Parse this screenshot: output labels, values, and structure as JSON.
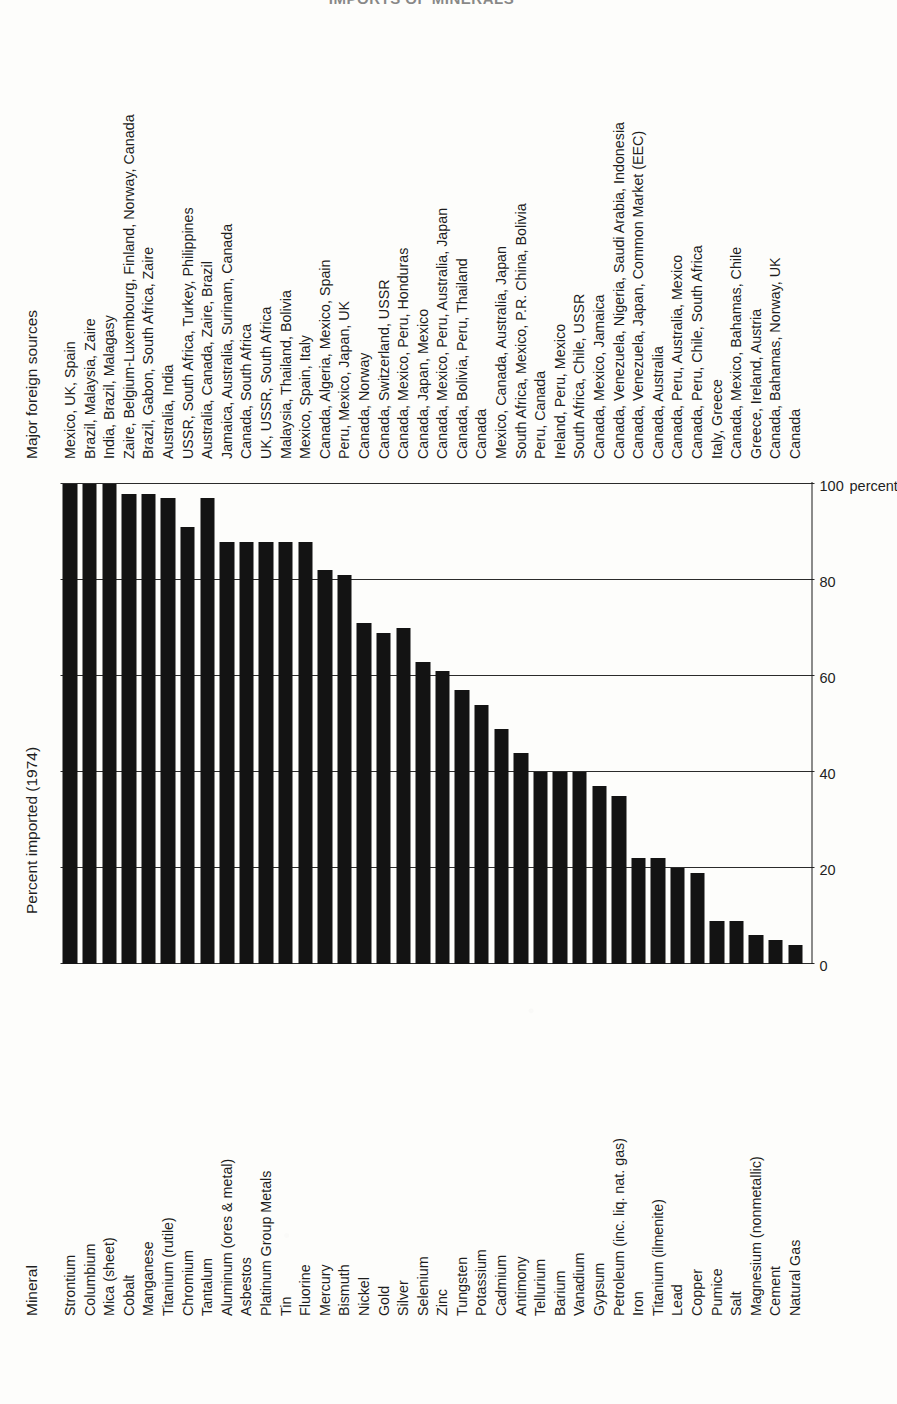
{
  "running_head": "IMPORTS OF MINERALS",
  "headers": {
    "mineral": "Mineral",
    "percent": "Percent imported (1974)",
    "sources": "Major foreign sources"
  },
  "axis": {
    "unit_label": "percent",
    "ticks": [
      "0",
      "20",
      "40",
      "60",
      "80",
      "100"
    ]
  },
  "chart_data": {
    "type": "bar",
    "title": "Percent imported (1974)",
    "xlabel": "percent",
    "ylabel": "Mineral",
    "xlim": [
      0,
      100
    ],
    "grid": true,
    "orientation": "horizontal",
    "legend": "none",
    "bar_color": "#131313",
    "categories": [
      "Strontium",
      "Columbium",
      "Mica (sheet)",
      "Cobalt",
      "Manganese",
      "Titanium (rutile)",
      "Chromium",
      "Tantalum",
      "Aluminum (ores & metal)",
      "Asbestos",
      "Platinum Group Metals",
      "Tin",
      "Fluorine",
      "Mercury",
      "Bismuth",
      "Nickel",
      "Gold",
      "Silver",
      "Selenium",
      "Zinc",
      "Tungsten",
      "Potassium",
      "Cadmium",
      "Antimony",
      "Tellurium",
      "Barium",
      "Vanadium",
      "Gypsum",
      "Petroleum (inc. liq. nat. gas)",
      "Iron",
      "Titanium (ilmenite)",
      "Lead",
      "Copper",
      "Pumice",
      "Salt",
      "Magnesium (nonmetallic)",
      "Cement",
      "Natural Gas"
    ],
    "values": [
      100,
      100,
      100,
      98,
      98,
      97,
      91,
      97,
      88,
      88,
      88,
      88,
      88,
      82,
      81,
      71,
      69,
      70,
      63,
      61,
      57,
      54,
      49,
      44,
      40,
      40,
      40,
      37,
      35,
      22,
      22,
      20,
      19,
      9,
      9,
      6,
      5,
      4
    ],
    "gridlines_at": [
      0,
      20,
      40,
      60,
      80,
      100
    ]
  },
  "sources": [
    "Mexico, UK, Spain",
    "Brazil, Malaysia, Zaire",
    "India, Brazil, Malagasy",
    "Zaire, Belgium-Luxembourg, Finland, Norway, Canada",
    "Brazil, Gabon, South Africa, Zaire",
    "Australia, India",
    "USSR, South Africa, Turkey, Philippines",
    "Australia, Canada, Zaire, Brazil",
    "Jamaica, Australia, Surinam, Canada",
    "Canada, South Africa",
    "UK, USSR, South Africa",
    "Malaysia, Thailand, Bolivia",
    "Mexico, Spain, Italy",
    "Canada, Algeria, Mexico, Spain",
    "Peru, Mexico, Japan, UK",
    "Canada, Norway",
    "Canada, Switzerland, USSR",
    "Canada, Mexico, Peru, Honduras",
    "Canada, Japan, Mexico",
    "Canada, Mexico, Peru, Australia, Japan",
    "Canada, Bolivia, Peru, Thailand",
    "Canada",
    "Mexico, Canada, Australia, Japan",
    "South Africa, Mexico, P.R. China, Bolivia",
    "Peru, Canada",
    "Ireland, Peru, Mexico",
    "South Africa, Chile, USSR",
    "Canada, Mexico, Jamaica",
    "Canada, Venezuela, Nigeria, Saudi Arabia, Indonesia",
    "Canada, Venezuela, Japan, Common Market (EEC)",
    "Canada, Australia",
    "Canada, Peru, Australia, Mexico",
    "Canada, Peru, Chile, South Africa",
    "Italy, Greece",
    "Canada, Mexico, Bahamas, Chile",
    "Greece, Ireland, Austria",
    "Canada, Bahamas, Norway, UK",
    "Canada"
  ]
}
